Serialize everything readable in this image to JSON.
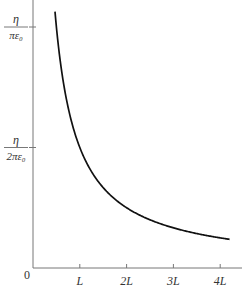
{
  "chart_data": {
    "type": "line",
    "title": "",
    "xlabel": "x",
    "ylabel": "",
    "function": "E(x) = η / (2πε₀ x)",
    "x_unit": "L",
    "y_unit": "η/(2πε₀)",
    "xlim": [
      0,
      4.3
    ],
    "ylim": [
      0,
      2.25
    ],
    "x_ticks": [
      {
        "value": 1,
        "label": "L"
      },
      {
        "value": 2,
        "label": "2L"
      },
      {
        "value": 3,
        "label": "3L"
      },
      {
        "value": 4,
        "label": "4L"
      }
    ],
    "y_ticks": [
      {
        "value": 1,
        "num": "η",
        "den": "2πε₀"
      },
      {
        "value": 2,
        "num": "η",
        "den": "πε₀"
      }
    ],
    "origin_label": "0",
    "series": [
      {
        "name": "field",
        "color": "#111111",
        "x_range": [
          0.47,
          4.2
        ]
      }
    ],
    "grid": false
  }
}
